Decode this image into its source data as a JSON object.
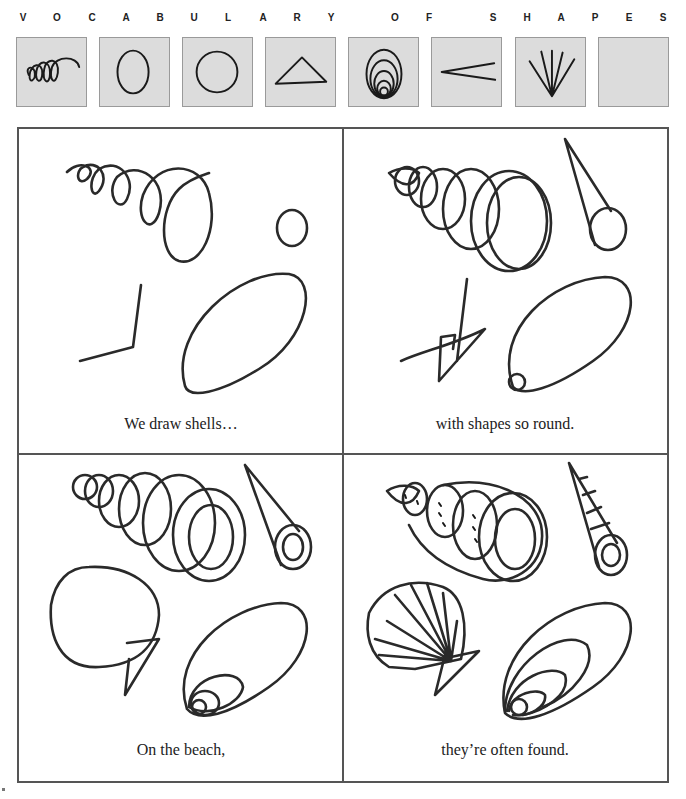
{
  "page": {
    "title_letters": [
      "V",
      "O",
      "C",
      "A",
      "B",
      "U",
      "L",
      "A",
      "R",
      "Y",
      "O",
      "F",
      "S",
      "H",
      "A",
      "P",
      "E",
      "S"
    ],
    "title_text": "VOCABULARY OF SHAPES"
  },
  "vocabulary": {
    "boxes": [
      {
        "shape": "spiral-coil"
      },
      {
        "shape": "oval"
      },
      {
        "shape": "circle"
      },
      {
        "shape": "triangle"
      },
      {
        "shape": "nested-ovals"
      },
      {
        "shape": "angle-lines"
      },
      {
        "shape": "fan-lines"
      },
      {
        "shape": "blank"
      }
    ]
  },
  "panels": [
    {
      "caption": "We draw shells…"
    },
    {
      "caption": "with shapes so round."
    },
    {
      "caption": "On the beach,"
    },
    {
      "caption": "they’re often found."
    }
  ],
  "colors": {
    "vocab_box_bg": "#dcdcdc",
    "line": "#2a2a2a",
    "border": "#555555"
  }
}
